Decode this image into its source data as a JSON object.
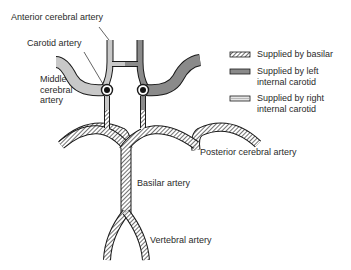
{
  "diagram": {
    "type": "anatomical",
    "colors": {
      "right_carotid": "#c8c8c8",
      "left_carotid": "#8a8a8a",
      "basilar_hatch": "#333333",
      "outline": "#1a1a1a"
    }
  },
  "labels": {
    "anterior_cerebral": "Anterior cerebral artery",
    "carotid": "Carotid artery",
    "middle_cerebral": "Middle\ncerebral\nartery",
    "posterior_cerebral": "Posterior cerebral artery",
    "basilar": "Basilar artery",
    "vertebral": "Vertebral artery"
  },
  "legend": {
    "items": [
      {
        "label": "Supplied by basilar",
        "pattern": "hatched"
      },
      {
        "label": "Supplied by left\ninternal carotid",
        "pattern": "dark-gray"
      },
      {
        "label": "Supplied by right\ninternal carotid",
        "pattern": "light-gray"
      }
    ]
  }
}
